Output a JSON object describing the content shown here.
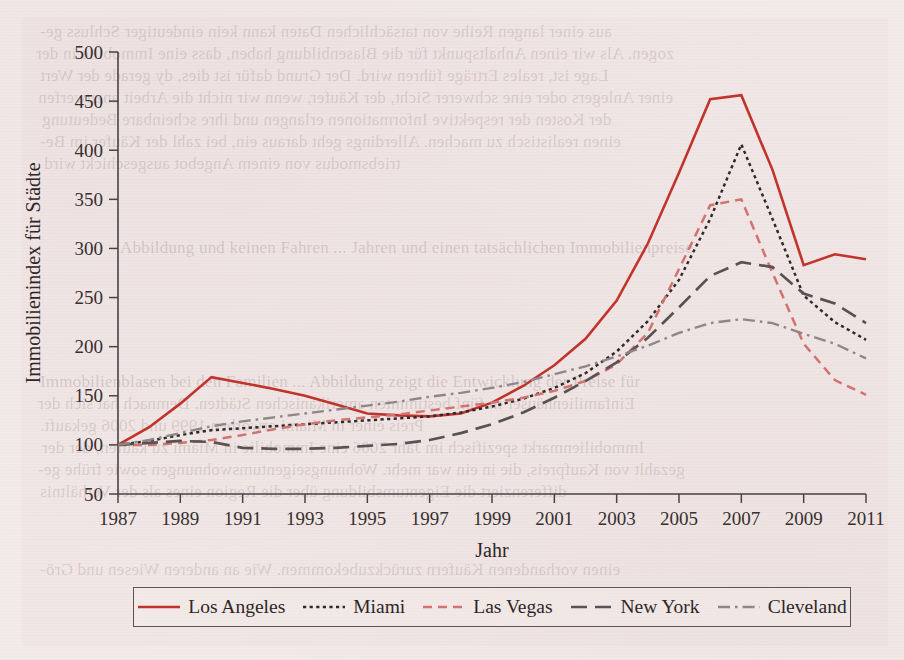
{
  "page": {
    "background_color": "#f3ebea",
    "paper_color": "#f1e7e6",
    "ghost_text": [
      "aus einer langen Reihe von tatsächlichen Daten kann kein eindeutiger Schluss ge-",
      "zogen. Als wir einen Anhaltspunkt für die Blasenbildung haben, dass eine Immobilie in der",
      "Lage ist, reales Erträge führen wird. Der Grund dafür ist dies, dy gerade der Wert",
      "einer Anlegers oder eine schwerer Sicht, der Käufer, wenn wir nicht die Arbeit anzuwerfen",
      "der Kosten der respektive Informationen erlangen und ihre scheinbare Bedeutung",
      "einen realistisch zu machen. Allerdings geht daraus ein, bei zahl der Käufer im Be-",
      "triebsmodus von einem Angebot ausgeschickt wird",
      "Abbildung und keinen Fahren ... Jahren und einen tatsächlichen Immobilienpreise",
      "Immobilienblasen bei den Familien ... Abbildung zeigt die Entwicklung der Preise für",
      "Einfamilienhäuser in fünf bestimmten amerikanischen Städten. Demnach hat sich der",
      "Preis einer in Miami erworben 1999 und 2006 gekauft.",
      "Immobilienmarkt spezifisch im Jahr 2006 eine Immobilie in Miami zu kaufen, der der",
      "gezahlt von Kaufpreis, die in ein war mehr. Wohnungseigentumswohnungen sowie frühe ge-",
      "differenziert die Eigentumsbildung über die Region eines als der Verhältnis",
      "einen vorhandenen Käufern zurückzubekommen. Wie an anderen Wiesen und Grö-"
    ]
  },
  "chart_data": {
    "type": "line",
    "title": "",
    "xlabel": "Jahr",
    "ylabel": "Immobilienindex für Städte",
    "xlim": [
      1987,
      2011
    ],
    "ylim": [
      50,
      500
    ],
    "yticks": [
      50,
      100,
      150,
      200,
      250,
      300,
      350,
      400,
      450,
      500
    ],
    "xticks": [
      1987,
      1989,
      1991,
      1993,
      1995,
      1997,
      1999,
      2001,
      2003,
      2005,
      2007,
      2009,
      2011
    ],
    "grid": false,
    "legend_position": "below",
    "x": [
      1987,
      1988,
      1989,
      1990,
      1991,
      1992,
      1993,
      1994,
      1995,
      1996,
      1997,
      1998,
      1999,
      2000,
      2001,
      2002,
      2003,
      2004,
      2005,
      2006,
      2007,
      2008,
      2009,
      2010,
      2011
    ],
    "series": [
      {
        "name": "Los Angeles",
        "color": "#c0342c",
        "style": "solid",
        "width": 2.6,
        "values": [
          100,
          118,
          142,
          169,
          163,
          157,
          150,
          141,
          132,
          130,
          129,
          132,
          143,
          160,
          181,
          208,
          247,
          305,
          377,
          452,
          456,
          380,
          283,
          294,
          289
        ]
      },
      {
        "name": "Miami",
        "color": "#2f2b2c",
        "style": "dotted",
        "width": 2.5,
        "values": [
          100,
          104,
          110,
          115,
          117,
          119,
          121,
          123,
          125,
          127,
          129,
          133,
          139,
          147,
          158,
          173,
          195,
          226,
          268,
          330,
          406,
          330,
          252,
          225,
          207
        ]
      },
      {
        "name": "Las Vegas",
        "color": "#d1736e",
        "style": "dashed",
        "width": 2.5,
        "values": [
          100,
          100,
          102,
          105,
          110,
          116,
          121,
          125,
          128,
          131,
          135,
          139,
          143,
          148,
          155,
          165,
          182,
          214,
          279,
          344,
          350,
          275,
          203,
          166,
          151
        ]
      },
      {
        "name": "New York",
        "color": "#595254",
        "style": "longdash",
        "width": 2.7,
        "values": [
          100,
          102,
          104,
          103,
          97,
          96,
          96,
          97,
          99,
          101,
          105,
          112,
          121,
          133,
          148,
          165,
          184,
          209,
          240,
          272,
          286,
          281,
          254,
          244,
          224
        ]
      },
      {
        "name": "Cleveland",
        "color": "#8d8789",
        "style": "dashdot",
        "width": 2.4,
        "values": [
          100,
          105,
          112,
          119,
          124,
          128,
          132,
          136,
          140,
          144,
          149,
          153,
          158,
          164,
          172,
          180,
          190,
          201,
          214,
          224,
          228,
          224,
          213,
          203,
          188
        ]
      }
    ]
  },
  "legend": {
    "entries": [
      {
        "label": "Los Angeles"
      },
      {
        "label": "Miami"
      },
      {
        "label": "Las Vegas"
      },
      {
        "label": "New York"
      },
      {
        "label": "Cleveland"
      }
    ]
  }
}
